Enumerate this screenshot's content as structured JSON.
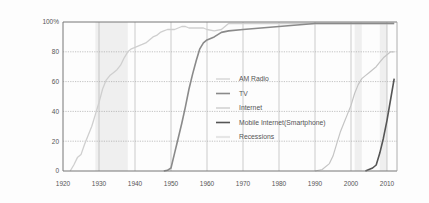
{
  "chart_data": {
    "type": "line",
    "title": "",
    "xlabel": "",
    "ylabel": "",
    "xlim": [
      1920,
      2012
    ],
    "ylim": [
      0,
      100
    ],
    "x_ticks": [
      "1920",
      "1930",
      "1940",
      "1950",
      "1960",
      "1970",
      "1980",
      "1990",
      "2000",
      "2010"
    ],
    "y_ticks": [
      "0",
      "20",
      "40",
      "60",
      "80",
      "100%"
    ],
    "grid": "dotted horizontal, solid vertical decade lines",
    "legend_position": "center-right inside plot",
    "series": [
      {
        "name": "AM Radio",
        "color": "#cfcfcf",
        "points": [
          [
            1922,
            0
          ],
          [
            1923,
            4
          ],
          [
            1924,
            9
          ],
          [
            1925,
            11
          ],
          [
            1926,
            18
          ],
          [
            1927,
            24
          ],
          [
            1928,
            30
          ],
          [
            1929,
            38
          ],
          [
            1930,
            46
          ],
          [
            1931,
            55
          ],
          [
            1932,
            61
          ],
          [
            1933,
            64
          ],
          [
            1934,
            66
          ],
          [
            1935,
            68
          ],
          [
            1936,
            71
          ],
          [
            1937,
            76
          ],
          [
            1938,
            80
          ],
          [
            1939,
            82
          ],
          [
            1940,
            83
          ],
          [
            1941,
            84
          ],
          [
            1942,
            85
          ],
          [
            1943,
            86
          ],
          [
            1944,
            88
          ],
          [
            1945,
            90
          ],
          [
            1946,
            91
          ],
          [
            1947,
            93
          ],
          [
            1948,
            94
          ],
          [
            1949,
            95
          ],
          [
            1950,
            95
          ],
          [
            1951,
            95
          ],
          [
            1952,
            96
          ],
          [
            1953,
            97
          ],
          [
            1954,
            97
          ],
          [
            1955,
            96
          ],
          [
            1956,
            96
          ],
          [
            1957,
            96
          ],
          [
            1958,
            96
          ],
          [
            1959,
            96
          ],
          [
            1960,
            95
          ],
          [
            1962,
            94
          ],
          [
            1964,
            95
          ],
          [
            1966,
            99
          ],
          [
            1970,
            99
          ],
          [
            1980,
            99
          ],
          [
            1990,
            99
          ],
          [
            2000,
            99
          ],
          [
            2012,
            99
          ]
        ]
      },
      {
        "name": "TV",
        "color": "#8a8a8a",
        "points": [
          [
            1948,
            0
          ],
          [
            1949,
            0.5
          ],
          [
            1950,
            2
          ],
          [
            1951,
            12
          ],
          [
            1952,
            22
          ],
          [
            1953,
            32
          ],
          [
            1954,
            43
          ],
          [
            1955,
            55
          ],
          [
            1956,
            65
          ],
          [
            1957,
            74
          ],
          [
            1958,
            82
          ],
          [
            1959,
            86
          ],
          [
            1960,
            88
          ],
          [
            1962,
            90
          ],
          [
            1964,
            93
          ],
          [
            1966,
            94
          ],
          [
            1970,
            95
          ],
          [
            1975,
            96
          ],
          [
            1980,
            97
          ],
          [
            1985,
            98
          ],
          [
            1990,
            99
          ],
          [
            2000,
            99
          ],
          [
            2012,
            99
          ]
        ]
      },
      {
        "name": "Internet",
        "color": "#c4c4c4",
        "points": [
          [
            1990,
            0
          ],
          [
            1992,
            1
          ],
          [
            1994,
            5
          ],
          [
            1995,
            10
          ],
          [
            1996,
            18
          ],
          [
            1997,
            26
          ],
          [
            1998,
            32
          ],
          [
            1999,
            38
          ],
          [
            2000,
            44
          ],
          [
            2001,
            52
          ],
          [
            2002,
            58
          ],
          [
            2003,
            62
          ],
          [
            2004,
            64
          ],
          [
            2005,
            66
          ],
          [
            2006,
            68
          ],
          [
            2007,
            70
          ],
          [
            2008,
            73
          ],
          [
            2009,
            76
          ],
          [
            2010,
            78
          ],
          [
            2011,
            80
          ],
          [
            2012,
            80
          ]
        ]
      },
      {
        "name": "Mobile Internet(Smartphone)",
        "color": "#555555",
        "points": [
          [
            2004,
            0
          ],
          [
            2005,
            1
          ],
          [
            2006,
            2
          ],
          [
            2007,
            4
          ],
          [
            2008,
            12
          ],
          [
            2009,
            22
          ],
          [
            2010,
            34
          ],
          [
            2011,
            48
          ],
          [
            2012,
            62
          ]
        ]
      }
    ],
    "recessions": [
      [
        1929,
        1938
      ],
      [
        2001,
        2003
      ],
      [
        2008,
        2010
      ]
    ],
    "recession_color": "#efefef"
  },
  "legend": {
    "items": [
      {
        "label": "AM Radio",
        "color": "#cfcfcf"
      },
      {
        "label": "TV",
        "color": "#8a8a8a"
      },
      {
        "label": "Internet",
        "color": "#c4c4c4"
      },
      {
        "label": "Mobile Internet(Smartphone)",
        "color": "#555555"
      },
      {
        "label": "Recessions",
        "color": "#e6e6e6"
      }
    ]
  }
}
